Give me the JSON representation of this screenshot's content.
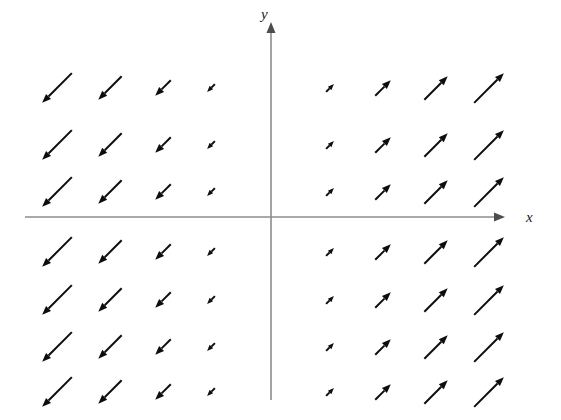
{
  "figure": {
    "title": "",
    "background_color": "#ffffff"
  },
  "axes": {
    "x_axis": {
      "label": "x",
      "color": "#8c8c8c",
      "stroke_width": 1.6,
      "x_start": 25,
      "x_end": 505,
      "y": 217,
      "arrowhead": "right",
      "label_x": 526,
      "label_y": 222
    },
    "y_axis": {
      "label": "y",
      "color": "#8c8c8c",
      "stroke_width": 1.6,
      "y_start": 400,
      "y_end": 22,
      "x": 271,
      "arrowhead": "up",
      "label_x": 261,
      "label_y": 19
    },
    "origin": {
      "x": 271,
      "y": 217
    }
  },
  "chart_data": {
    "type": "quiver",
    "title": "",
    "xlabel": "x",
    "ylabel": "y",
    "grid": false,
    "legend": null,
    "field_formula": "F(x, y) = (x, x)",
    "xlim": [
      -4,
      4
    ],
    "ylim": [
      -4,
      3
    ],
    "x_values": [
      -4,
      -3,
      -2,
      -1,
      1,
      2,
      3,
      4
    ],
    "y_values": [
      3,
      2,
      1,
      -1,
      -2,
      -3,
      -4
    ],
    "arrow_color": "#0d0d0d",
    "arrow_stroke_width": 2.0,
    "arrow_head_length": 9,
    "arrow_head_width": 7,
    "column_pixel_centers": [
      57,
      110,
      163,
      211,
      330,
      383,
      436,
      489
    ],
    "row_pixel_centers": [
      88,
      145,
      192,
      252,
      300,
      347,
      392
    ],
    "magnitude_by_column": [
      42,
      33,
      22,
      11,
      11,
      22,
      33,
      42
    ],
    "direction_by_column": [
      "down-left",
      "down-left",
      "down-left",
      "down-left",
      "up-right",
      "up-right",
      "up-right",
      "up-right"
    ],
    "vectors": [
      {
        "x": -4,
        "y": 3,
        "u": -4,
        "v": -4,
        "px": 57,
        "py": 88,
        "len": 42,
        "dir": "down-left"
      },
      {
        "x": -3,
        "y": 3,
        "u": -3,
        "v": -3,
        "px": 110,
        "py": 88,
        "len": 33,
        "dir": "down-left"
      },
      {
        "x": -2,
        "y": 3,
        "u": -2,
        "v": -2,
        "px": 163,
        "py": 88,
        "len": 22,
        "dir": "down-left"
      },
      {
        "x": -1,
        "y": 3,
        "u": -1,
        "v": -1,
        "px": 211,
        "py": 88,
        "len": 11,
        "dir": "down-left"
      },
      {
        "x": 1,
        "y": 3,
        "u": 1,
        "v": 1,
        "px": 330,
        "py": 88,
        "len": 11,
        "dir": "up-right"
      },
      {
        "x": 2,
        "y": 3,
        "u": 2,
        "v": 2,
        "px": 383,
        "py": 88,
        "len": 22,
        "dir": "up-right"
      },
      {
        "x": 3,
        "y": 3,
        "u": 3,
        "v": 3,
        "px": 436,
        "py": 88,
        "len": 33,
        "dir": "up-right"
      },
      {
        "x": 4,
        "y": 3,
        "u": 4,
        "v": 4,
        "px": 489,
        "py": 88,
        "len": 42,
        "dir": "up-right"
      },
      {
        "x": -4,
        "y": 2,
        "u": -4,
        "v": -4,
        "px": 57,
        "py": 145,
        "len": 42,
        "dir": "down-left"
      },
      {
        "x": -3,
        "y": 2,
        "u": -3,
        "v": -3,
        "px": 110,
        "py": 145,
        "len": 33,
        "dir": "down-left"
      },
      {
        "x": -2,
        "y": 2,
        "u": -2,
        "v": -2,
        "px": 163,
        "py": 145,
        "len": 22,
        "dir": "down-left"
      },
      {
        "x": -1,
        "y": 2,
        "u": -1,
        "v": -1,
        "px": 211,
        "py": 145,
        "len": 11,
        "dir": "down-left"
      },
      {
        "x": 1,
        "y": 2,
        "u": 1,
        "v": 1,
        "px": 330,
        "py": 145,
        "len": 11,
        "dir": "up-right"
      },
      {
        "x": 2,
        "y": 2,
        "u": 2,
        "v": 2,
        "px": 383,
        "py": 145,
        "len": 22,
        "dir": "up-right"
      },
      {
        "x": 3,
        "y": 2,
        "u": 3,
        "v": 3,
        "px": 436,
        "py": 145,
        "len": 33,
        "dir": "up-right"
      },
      {
        "x": 4,
        "y": 2,
        "u": 4,
        "v": 4,
        "px": 489,
        "py": 145,
        "len": 42,
        "dir": "up-right"
      },
      {
        "x": -4,
        "y": 1,
        "u": -4,
        "v": -4,
        "px": 57,
        "py": 192,
        "len": 42,
        "dir": "down-left"
      },
      {
        "x": -3,
        "y": 1,
        "u": -3,
        "v": -3,
        "px": 110,
        "py": 192,
        "len": 33,
        "dir": "down-left"
      },
      {
        "x": -2,
        "y": 1,
        "u": -2,
        "v": -2,
        "px": 163,
        "py": 192,
        "len": 22,
        "dir": "down-left"
      },
      {
        "x": -1,
        "y": 1,
        "u": -1,
        "v": -1,
        "px": 211,
        "py": 192,
        "len": 11,
        "dir": "down-left"
      },
      {
        "x": 1,
        "y": 1,
        "u": 1,
        "v": 1,
        "px": 330,
        "py": 192,
        "len": 11,
        "dir": "up-right"
      },
      {
        "x": 2,
        "y": 1,
        "u": 2,
        "v": 2,
        "px": 383,
        "py": 192,
        "len": 22,
        "dir": "up-right"
      },
      {
        "x": 3,
        "y": 1,
        "u": 3,
        "v": 3,
        "px": 436,
        "py": 192,
        "len": 33,
        "dir": "up-right"
      },
      {
        "x": 4,
        "y": 1,
        "u": 4,
        "v": 4,
        "px": 489,
        "py": 192,
        "len": 42,
        "dir": "up-right"
      },
      {
        "x": -4,
        "y": -1,
        "u": -4,
        "v": -4,
        "px": 57,
        "py": 252,
        "len": 42,
        "dir": "down-left"
      },
      {
        "x": -3,
        "y": -1,
        "u": -3,
        "v": -3,
        "px": 110,
        "py": 252,
        "len": 33,
        "dir": "down-left"
      },
      {
        "x": -2,
        "y": -1,
        "u": -2,
        "v": -2,
        "px": 163,
        "py": 252,
        "len": 22,
        "dir": "down-left"
      },
      {
        "x": -1,
        "y": -1,
        "u": -1,
        "v": -1,
        "px": 211,
        "py": 252,
        "len": 11,
        "dir": "down-left"
      },
      {
        "x": 1,
        "y": -1,
        "u": 1,
        "v": 1,
        "px": 330,
        "py": 252,
        "len": 11,
        "dir": "up-right"
      },
      {
        "x": 2,
        "y": -1,
        "u": 2,
        "v": 2,
        "px": 383,
        "py": 252,
        "len": 22,
        "dir": "up-right"
      },
      {
        "x": 3,
        "y": -1,
        "u": 3,
        "v": 3,
        "px": 436,
        "py": 252,
        "len": 33,
        "dir": "up-right"
      },
      {
        "x": 4,
        "y": -1,
        "u": 4,
        "v": 4,
        "px": 489,
        "py": 252,
        "len": 42,
        "dir": "up-right"
      },
      {
        "x": -4,
        "y": -2,
        "u": -4,
        "v": -4,
        "px": 57,
        "py": 300,
        "len": 42,
        "dir": "down-left"
      },
      {
        "x": -3,
        "y": -2,
        "u": -3,
        "v": -3,
        "px": 110,
        "py": 300,
        "len": 33,
        "dir": "down-left"
      },
      {
        "x": -2,
        "y": -2,
        "u": -2,
        "v": -2,
        "px": 163,
        "py": 300,
        "len": 22,
        "dir": "down-left"
      },
      {
        "x": -1,
        "y": -2,
        "u": -1,
        "v": -1,
        "px": 211,
        "py": 300,
        "len": 11,
        "dir": "down-left"
      },
      {
        "x": 1,
        "y": -2,
        "u": 1,
        "v": 1,
        "px": 330,
        "py": 300,
        "len": 11,
        "dir": "up-right"
      },
      {
        "x": 2,
        "y": -2,
        "u": 2,
        "v": 2,
        "px": 383,
        "py": 300,
        "len": 22,
        "dir": "up-right"
      },
      {
        "x": 3,
        "y": -2,
        "u": 3,
        "v": 3,
        "px": 436,
        "py": 300,
        "len": 33,
        "dir": "up-right"
      },
      {
        "x": 4,
        "y": -2,
        "u": 4,
        "v": 4,
        "px": 489,
        "py": 300,
        "len": 42,
        "dir": "up-right"
      },
      {
        "x": -4,
        "y": -3,
        "u": -4,
        "v": -4,
        "px": 57,
        "py": 347,
        "len": 42,
        "dir": "down-left"
      },
      {
        "x": -3,
        "y": -3,
        "u": -3,
        "v": -3,
        "px": 110,
        "py": 347,
        "len": 33,
        "dir": "down-left"
      },
      {
        "x": -2,
        "y": -3,
        "u": -2,
        "v": -2,
        "px": 163,
        "py": 347,
        "len": 22,
        "dir": "down-left"
      },
      {
        "x": -1,
        "y": -3,
        "u": -1,
        "v": -1,
        "px": 211,
        "py": 347,
        "len": 11,
        "dir": "down-left"
      },
      {
        "x": 1,
        "y": -3,
        "u": 1,
        "v": 1,
        "px": 330,
        "py": 347,
        "len": 11,
        "dir": "up-right"
      },
      {
        "x": 2,
        "y": -3,
        "u": 2,
        "v": 2,
        "px": 383,
        "py": 347,
        "len": 22,
        "dir": "up-right"
      },
      {
        "x": 3,
        "y": -3,
        "u": 3,
        "v": 3,
        "px": 436,
        "py": 347,
        "len": 33,
        "dir": "up-right"
      },
      {
        "x": 4,
        "y": -3,
        "u": 4,
        "v": 4,
        "px": 489,
        "py": 347,
        "len": 42,
        "dir": "up-right"
      },
      {
        "x": -4,
        "y": -4,
        "u": -4,
        "v": -4,
        "px": 57,
        "py": 392,
        "len": 42,
        "dir": "down-left"
      },
      {
        "x": -3,
        "y": -4,
        "u": -3,
        "v": -3,
        "px": 110,
        "py": 392,
        "len": 33,
        "dir": "down-left"
      },
      {
        "x": -2,
        "y": -4,
        "u": -2,
        "v": -2,
        "px": 163,
        "py": 392,
        "len": 22,
        "dir": "down-left"
      },
      {
        "x": -1,
        "y": -4,
        "u": -1,
        "v": -1,
        "px": 211,
        "py": 392,
        "len": 11,
        "dir": "down-left"
      },
      {
        "x": 1,
        "y": -4,
        "u": 1,
        "v": 1,
        "px": 330,
        "py": 392,
        "len": 11,
        "dir": "up-right"
      },
      {
        "x": 2,
        "y": -4,
        "u": 2,
        "v": 2,
        "px": 383,
        "py": 392,
        "len": 22,
        "dir": "up-right"
      },
      {
        "x": 3,
        "y": -4,
        "u": 3,
        "v": 3,
        "px": 436,
        "py": 392,
        "len": 33,
        "dir": "up-right"
      },
      {
        "x": 4,
        "y": -4,
        "u": 4,
        "v": 4,
        "px": 489,
        "py": 392,
        "len": 42,
        "dir": "up-right"
      }
    ]
  }
}
